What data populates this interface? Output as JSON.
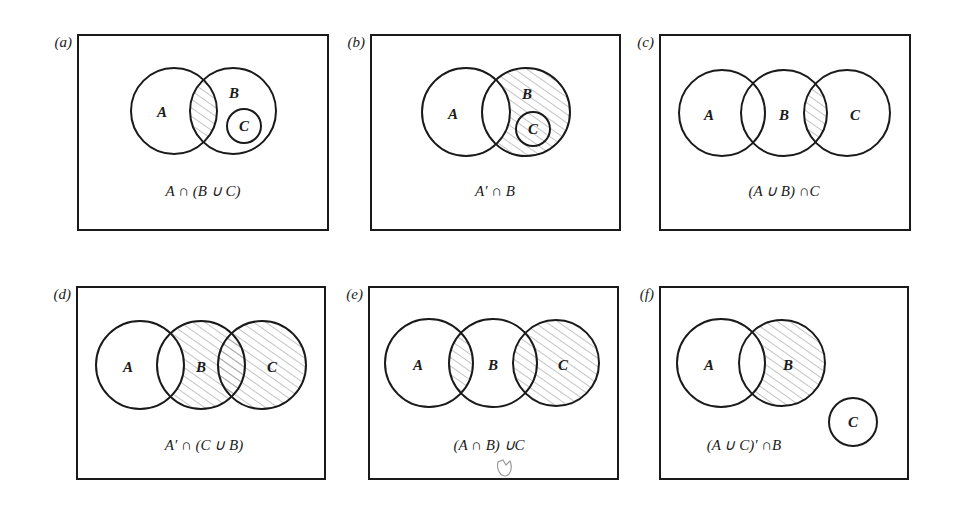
{
  "figure": {
    "title": "Venn diagrams of set operations",
    "colors": {
      "ink": "#1a1a1a",
      "hatch": "#8a8a8a",
      "background": "#ffffff"
    }
  },
  "panels": [
    {
      "tag": "(a)",
      "expression": "A ∩ (B ∪ C)",
      "box": {
        "x": 78,
        "y": 35,
        "w": 250,
        "h": 195
      },
      "caption_pos": {
        "x": 203,
        "y": 196
      },
      "circles": [
        {
          "name": "A",
          "cx": 174,
          "cy": 111,
          "r": 43,
          "label_x": 162,
          "label_y": 117
        },
        {
          "name": "B",
          "cx": 233,
          "cy": 111,
          "r": 43,
          "label_x": 234,
          "label_y": 98
        },
        {
          "name": "C",
          "cx": 244,
          "cy": 126,
          "r": 17,
          "label_x": 244,
          "label_y": 131
        }
      ],
      "shaded_region": "A∩B",
      "shading": [
        {
          "clip": [
            "A"
          ],
          "within": "B"
        }
      ]
    },
    {
      "tag": "(b)",
      "expression": "A′ ∩ B",
      "box": {
        "x": 371,
        "y": 35,
        "w": 249,
        "h": 195
      },
      "caption_pos": {
        "x": 495,
        "y": 196
      },
      "circles": [
        {
          "name": "A",
          "cx": 466,
          "cy": 112,
          "r": 44,
          "label_x": 453,
          "label_y": 119
        },
        {
          "name": "B",
          "cx": 526,
          "cy": 112,
          "r": 44,
          "label_x": 527,
          "label_y": 99
        },
        {
          "name": "C",
          "cx": 533,
          "cy": 129,
          "r": 17,
          "label_x": 533,
          "label_y": 134
        }
      ],
      "shaded_region": "B − A",
      "shading": [
        {
          "clip": [
            "B"
          ],
          "exclude": "A"
        }
      ]
    },
    {
      "tag": "(c)",
      "expression": "(A ∪ B) ∩C",
      "box": {
        "x": 660,
        "y": 35,
        "w": 250,
        "h": 195
      },
      "caption_pos": {
        "x": 784,
        "y": 196
      },
      "circles": [
        {
          "name": "A",
          "cx": 722,
          "cy": 113,
          "r": 43,
          "label_x": 709,
          "label_y": 120
        },
        {
          "name": "B",
          "cx": 784,
          "cy": 113,
          "r": 43,
          "label_x": 784,
          "label_y": 120
        },
        {
          "name": "C",
          "cx": 847,
          "cy": 113,
          "r": 43,
          "label_x": 855,
          "label_y": 120
        }
      ],
      "shaded_region": "B∩C",
      "shading": [
        {
          "clip": [
            "B"
          ],
          "within": "C"
        }
      ]
    },
    {
      "tag": "(d)",
      "expression": "A′ ∩ (C ∪ B)",
      "box": {
        "x": 77,
        "y": 287,
        "w": 248,
        "h": 192
      },
      "caption_pos": {
        "x": 204,
        "y": 450
      },
      "circles": [
        {
          "name": "A",
          "cx": 140,
          "cy": 365,
          "r": 44,
          "label_x": 128,
          "label_y": 372
        },
        {
          "name": "B",
          "cx": 201,
          "cy": 365,
          "r": 44,
          "label_x": 201,
          "label_y": 372
        },
        {
          "name": "C",
          "cx": 262,
          "cy": 365,
          "r": 44,
          "label_x": 272,
          "label_y": 372
        }
      ],
      "shaded_region": "(B ∪ C) − A",
      "shading": [
        {
          "clip": [
            "B"
          ],
          "exclude": "A"
        },
        {
          "clip": [
            "C"
          ],
          "exclude": "A"
        }
      ]
    },
    {
      "tag": "(e)",
      "expression": "(A ∩ B) ∪C",
      "box": {
        "x": 369,
        "y": 287,
        "w": 249,
        "h": 192
      },
      "caption_pos": {
        "x": 489,
        "y": 450
      },
      "circles": [
        {
          "name": "A",
          "cx": 429,
          "cy": 363,
          "r": 44,
          "label_x": 418,
          "label_y": 370
        },
        {
          "name": "B",
          "cx": 493,
          "cy": 363,
          "r": 44,
          "label_x": 493,
          "label_y": 370
        },
        {
          "name": "C",
          "cx": 556,
          "cy": 363,
          "r": 43,
          "label_x": 563,
          "label_y": 370
        }
      ],
      "shaded_region": "(A∩B) ∪ C",
      "shading": [
        {
          "clip": [
            "A"
          ],
          "within": "B"
        },
        {
          "clip": [
            "C"
          ]
        }
      ],
      "doodle": {
        "x": 505,
        "y": 468
      }
    },
    {
      "tag": "(f)",
      "expression": "(A ∪ C)′ ∩B",
      "box": {
        "x": 660,
        "y": 287,
        "w": 248,
        "h": 192
      },
      "caption_pos": {
        "x": 744,
        "y": 450
      },
      "circles": [
        {
          "name": "A",
          "cx": 721,
          "cy": 363,
          "r": 44,
          "label_x": 709,
          "label_y": 370
        },
        {
          "name": "B",
          "cx": 782,
          "cy": 363,
          "r": 43,
          "label_x": 788,
          "label_y": 370
        },
        {
          "name": "C",
          "cx": 853,
          "cy": 422,
          "r": 24,
          "label_x": 853,
          "label_y": 427
        }
      ],
      "shaded_region": "B − A",
      "shading": [
        {
          "clip": [
            "B"
          ],
          "exclude": "A"
        }
      ]
    }
  ]
}
